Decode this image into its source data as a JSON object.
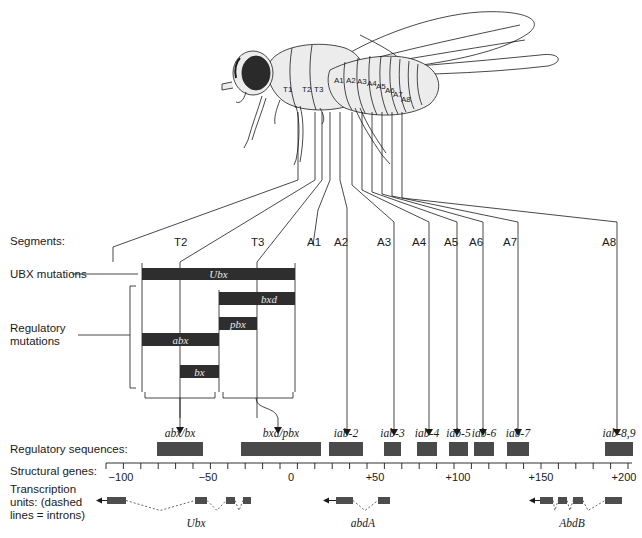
{
  "row_labels": {
    "segments": "Segments:",
    "ubx_mutations": "UBX mutations",
    "regulatory_mutations_line1": "Regulatory",
    "regulatory_mutations_line2": "mutations",
    "regulatory_sequences": "Regulatory sequences:",
    "structural_genes": "Structural genes:",
    "transcription_line1": "Transcription",
    "transcription_line2": "units:  (dashed",
    "transcription_line3": "lines = introns)"
  },
  "fly_segments": [
    "T1",
    "T2",
    "T3",
    "A1",
    "A2",
    "A3",
    "A4",
    "A5",
    "A6",
    "A7",
    "A8"
  ],
  "segments": [
    {
      "label": "T2",
      "x": 180
    },
    {
      "label": "T3",
      "x": 257
    },
    {
      "label": "A1",
      "x": 313
    },
    {
      "label": "A2",
      "x": 340
    },
    {
      "label": "A3",
      "x": 383
    },
    {
      "label": "A4",
      "x": 418
    },
    {
      "label": "A5",
      "x": 450
    },
    {
      "label": "A6",
      "x": 475
    },
    {
      "label": "A7",
      "x": 509
    },
    {
      "label": "A8",
      "x": 608
    }
  ],
  "mutation_bars": [
    {
      "label": "Ubx",
      "x1": 142,
      "x2": 295,
      "y": 268,
      "h": 12
    },
    {
      "label": "bxd",
      "x1": 219,
      "x2": 295,
      "y": 292,
      "h": 13
    },
    {
      "label": "pbx",
      "x1": 219,
      "x2": 257,
      "y": 317,
      "h": 13
    },
    {
      "label": "abx",
      "x1": 142,
      "x2": 219,
      "y": 333,
      "h": 13
    },
    {
      "label": "bx",
      "x1": 180,
      "x2": 219,
      "y": 365,
      "h": 13
    }
  ],
  "regulatory_sequences": [
    {
      "label": "abx/bx",
      "x1": 157,
      "x2": 203
    },
    {
      "label": "bxd/pbx",
      "x1": 241,
      "x2": 321
    },
    {
      "label": "iab-2",
      "x1": 329,
      "x2": 363
    },
    {
      "label": "iab-3",
      "x1": 384,
      "x2": 401
    },
    {
      "label": "iab-4",
      "x1": 417,
      "x2": 437
    },
    {
      "label": "iab-5",
      "x1": 449,
      "x2": 468
    },
    {
      "label": "iab-6",
      "x1": 474,
      "x2": 494
    },
    {
      "label": "iab-7",
      "x1": 507,
      "x2": 529
    },
    {
      "label": "iab-8,9",
      "x1": 605,
      "x2": 633
    }
  ],
  "axis": {
    "x_start": 106,
    "x_end": 632,
    "ticks": [
      {
        "label": "−100",
        "x": 121
      },
      {
        "label": "−50",
        "x": 208
      },
      {
        "label": "0",
        "x": 291
      },
      {
        "label": "+50",
        "x": 375
      },
      {
        "label": "+100",
        "x": 458
      },
      {
        "label": "+150",
        "x": 541
      },
      {
        "label": "+200",
        "x": 624
      }
    ]
  },
  "genes": [
    {
      "name": "Ubx",
      "label_x": 196,
      "arrow_x": 96,
      "exons": [
        [
          107,
          126
        ],
        [
          195,
          207
        ],
        [
          226,
          235
        ],
        [
          243,
          251
        ]
      ],
      "introns": [
        [
          126,
          160,
          195
        ],
        [
          207,
          217,
          226
        ],
        [
          235,
          239,
          243
        ]
      ]
    },
    {
      "name": "abdA",
      "label_x": 363,
      "arrow_x": 323,
      "exons": [
        [
          336,
          353
        ],
        [
          378,
          390
        ]
      ],
      "introns": [
        [
          353,
          365,
          378
        ]
      ]
    },
    {
      "name": "AbdB",
      "label_x": 572,
      "arrow_x": 529,
      "exons": [
        [
          540,
          553
        ],
        [
          558,
          567
        ],
        [
          573,
          583
        ],
        [
          605,
          622
        ]
      ],
      "introns": [
        [
          553,
          555,
          558
        ],
        [
          567,
          570,
          573
        ],
        [
          583,
          588,
          605
        ]
      ]
    }
  ],
  "colors": {
    "bar_dark": "#2e2e2e",
    "reg_box": "#4a4a4a",
    "exon": "#4d4d4d",
    "fly_body": "#ececec",
    "eye": "#2a2a2a",
    "line": "#1a1a1a"
  },
  "chart_data": {
    "type": "diagram",
    "axis_label": "Structural genes (kb)",
    "axis_range": [
      -110,
      205
    ],
    "axis_ticks": [
      -100,
      -50,
      0,
      50,
      100,
      150,
      200
    ],
    "segments": [
      "T2",
      "T3",
      "A1",
      "A2",
      "A3",
      "A4",
      "A5",
      "A6",
      "A7",
      "A8"
    ],
    "mutations": [
      "Ubx",
      "bxd",
      "pbx",
      "abx",
      "bx"
    ],
    "regulatory_sequences": [
      "abx/bx",
      "bxd/pbx",
      "iab-2",
      "iab-3",
      "iab-4",
      "iab-5",
      "iab-6",
      "iab-7",
      "iab-8,9"
    ],
    "transcription_units": [
      "Ubx",
      "abdA",
      "AbdB"
    ]
  }
}
